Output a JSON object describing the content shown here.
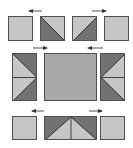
{
  "title": "Quilt block construction diagram",
  "colors": {
    "light": "#c6c6c6",
    "dark": "#727272",
    "medium": "#a9a9a9",
    "border": "#505050",
    "arrow": "#333333"
  },
  "rows": [
    {
      "name": "top-row",
      "pieces": [
        {
          "type": "plain-square",
          "fill": "light"
        },
        {
          "type": "half-square-triangle",
          "orientation": "dark-lower-left"
        },
        {
          "type": "half-square-triangle",
          "orientation": "dark-lower-right"
        },
        {
          "type": "plain-square",
          "fill": "light"
        }
      ],
      "arrows": [
        {
          "direction": "left"
        },
        {
          "direction": "right"
        }
      ]
    },
    {
      "name": "middle-row",
      "pieces": [
        {
          "type": "flying-geese-pair",
          "orientation": "point-right"
        },
        {
          "type": "center-square",
          "fill": "medium"
        },
        {
          "type": "flying-geese-pair",
          "orientation": "point-left"
        }
      ],
      "arrows": [
        {
          "direction": "right"
        },
        {
          "direction": "left"
        }
      ]
    },
    {
      "name": "bottom-row",
      "pieces": [
        {
          "type": "plain-square",
          "fill": "light"
        },
        {
          "type": "flying-geese-pair",
          "orientation": "point-up"
        },
        {
          "type": "plain-square",
          "fill": "light"
        }
      ],
      "arrows": [
        {
          "direction": "left"
        },
        {
          "direction": "right"
        }
      ]
    }
  ]
}
